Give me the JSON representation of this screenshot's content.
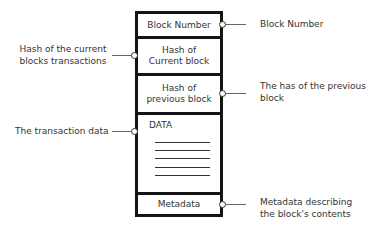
{
  "diagram": {
    "block_sections": [
      {
        "id": "block-number",
        "label": "Block Number"
      },
      {
        "id": "hash-current",
        "label_line1": "Hash of",
        "label_line2": "Current block"
      },
      {
        "id": "hash-previous",
        "label_line1": "Hash of",
        "label_line2": "previous block"
      },
      {
        "id": "data",
        "label": "DATA",
        "line_count": 5
      },
      {
        "id": "metadata",
        "label": "Metadata"
      }
    ],
    "annotations": {
      "right": [
        {
          "target": "block-number",
          "line1": "Block Number"
        },
        {
          "target": "hash-previous",
          "line1": "The has of the previous",
          "line2": "block"
        },
        {
          "target": "metadata",
          "line1": "Metadata describing",
          "line2": "the block's contents"
        }
      ],
      "left": [
        {
          "target": "hash-current",
          "line1": "Hash of the current",
          "line2": "blocks transactions"
        },
        {
          "target": "data",
          "line1": "The transaction data"
        }
      ]
    },
    "colors": {
      "border": "#141414",
      "text": "#333333",
      "connector": "#666666",
      "background": "#ffffff"
    }
  }
}
